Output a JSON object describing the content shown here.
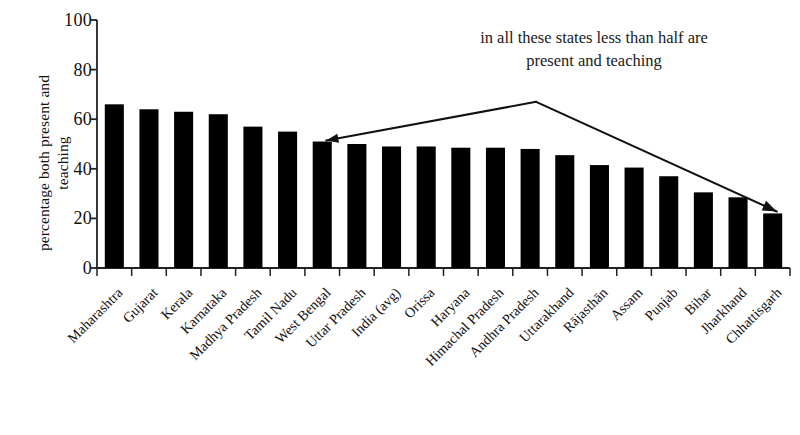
{
  "chart_data": {
    "type": "bar",
    "title": "",
    "subtitle": "",
    "xlabel": "",
    "ylabel": "percentage both present and teaching",
    "ylabel_lines": [
      "percentage both present and",
      "teaching"
    ],
    "ylim": [
      0,
      100
    ],
    "yticks": [
      0,
      20,
      40,
      60,
      80,
      100
    ],
    "ytick_labels": [
      "0",
      "20",
      "40",
      "60",
      "80",
      "100"
    ],
    "grid": false,
    "legend": null,
    "bar_color": "#000000",
    "axis_color": "#222222",
    "background_color": "#ffffff",
    "categories": [
      "Maharashtra",
      "Gujarat",
      "Kerala",
      "Karnataka",
      "Madhya Pradesh",
      "Tamil Nadu",
      "West Bengal",
      "Uttar Pradesh",
      "India (avg)",
      "Orissa",
      "Haryana",
      "Himachal Pradesh",
      "Andhra Pradesh",
      "Uttarakhand",
      "Rājasthān",
      "Assam",
      "Punjab",
      "Bihar",
      "Jharkhand",
      "Chhattisgarh"
    ],
    "values": [
      66,
      64,
      63,
      62,
      57,
      55,
      51,
      50,
      49,
      49,
      48.5,
      48.5,
      48,
      45.5,
      41.5,
      40.5,
      37,
      30.5,
      28.5,
      22
    ],
    "annotations": [
      {
        "id": "less-than-half-note",
        "text": "in all these states less than half are present and teaching",
        "lines": [
          "in all these states less than half are",
          "present and teaching"
        ],
        "arrow": {
          "style": "double-headed-bent",
          "from_category": "West Bengal",
          "to_category": "Chhattisgarh",
          "apex_above_category": "Andhra Pradesh"
        }
      }
    ]
  }
}
